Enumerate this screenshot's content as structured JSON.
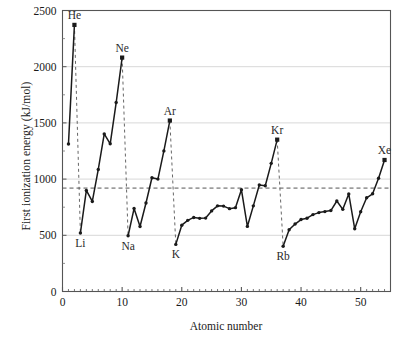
{
  "chart_data": {
    "type": "line",
    "title": "",
    "xlabel": "Atomic number",
    "ylabel": "First ionization energy (kJ/mol)",
    "xlim": [
      0,
      55
    ],
    "ylim": [
      0,
      2500
    ],
    "xticks": [
      0,
      10,
      20,
      30,
      40,
      50
    ],
    "xtick_labels": [
      "0",
      "10",
      "20",
      "30",
      "40",
      "50"
    ],
    "yticks": [
      0,
      500,
      1000,
      1500,
      2000,
      2500
    ],
    "ytick_labels": [
      "0",
      "500",
      "1000",
      "1500",
      "2000",
      "2500"
    ],
    "grid": "horizontal",
    "legend": "none",
    "markers": "filled-square-dot",
    "line_color": "#1a1a1a",
    "grid_color": "#d8d8d8",
    "guide_color": "#555555",
    "reference_line": {
      "orientation": "horizontal",
      "value": 920,
      "style": "dashed"
    },
    "drop_lines": {
      "style": "dashed",
      "at_x": [
        2,
        10,
        18,
        36
      ],
      "note": "dashed verticals from each noble-gas maximum down to the following alkali-metal minimum"
    },
    "annotations": [
      {
        "text": "He",
        "x": 2,
        "y": 2372,
        "pos": "above"
      },
      {
        "text": "Ne",
        "x": 10,
        "y": 2081,
        "pos": "above"
      },
      {
        "text": "Ar",
        "x": 18,
        "y": 1521,
        "pos": "above"
      },
      {
        "text": "Kr",
        "x": 36,
        "y": 1351,
        "pos": "above"
      },
      {
        "text": "Xe",
        "x": 54,
        "y": 1170,
        "pos": "above"
      },
      {
        "text": "Li",
        "x": 3,
        "y": 520,
        "pos": "below"
      },
      {
        "text": "Na",
        "x": 11,
        "y": 496,
        "pos": "below"
      },
      {
        "text": "K",
        "x": 19,
        "y": 419,
        "pos": "below"
      },
      {
        "text": "Rb",
        "x": 37,
        "y": 403,
        "pos": "below"
      }
    ],
    "x": [
      1,
      2,
      3,
      4,
      5,
      6,
      7,
      8,
      9,
      10,
      11,
      12,
      13,
      14,
      15,
      16,
      17,
      18,
      19,
      20,
      21,
      22,
      23,
      24,
      25,
      26,
      27,
      28,
      29,
      30,
      31,
      32,
      33,
      34,
      35,
      36,
      37,
      38,
      39,
      40,
      41,
      42,
      43,
      44,
      45,
      46,
      47,
      48,
      49,
      50,
      51,
      52,
      53,
      54
    ],
    "values": [
      1312,
      2372,
      520,
      899,
      801,
      1086,
      1402,
      1314,
      1681,
      2081,
      496,
      738,
      578,
      787,
      1012,
      1000,
      1251,
      1521,
      419,
      590,
      633,
      659,
      651,
      653,
      717,
      762,
      760,
      737,
      746,
      906,
      579,
      762,
      947,
      941,
      1140,
      1351,
      403,
      549,
      600,
      640,
      652,
      684,
      702,
      711,
      720,
      805,
      731,
      868,
      558,
      709,
      834,
      869,
      1008,
      1170
    ],
    "series_name": "First ionization energy"
  },
  "axis": {
    "x_title": "Atomic number",
    "y_title": "First ionization energy (kJ/mol)"
  }
}
